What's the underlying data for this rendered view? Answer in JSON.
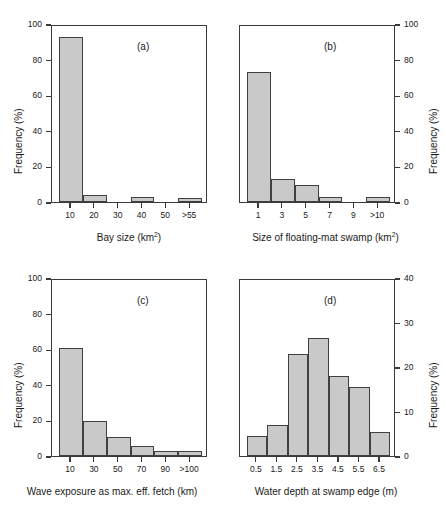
{
  "figure": {
    "panel_count": 4,
    "bar_fill_color": "#c9c9c9",
    "bar_edge_color": "#404040",
    "axis_color": "#3a3a3a"
  },
  "chart_data": [
    {
      "type": "bar",
      "panel": "(a)",
      "title": "",
      "xlabel_text": "Bay size (km",
      "xlabel_sup": "2",
      "xlabel_tail": ")",
      "ylabel": "Frequency (%)",
      "axis_side": "left",
      "categories": [
        "10",
        "20",
        "30",
        "40",
        "50",
        ">55"
      ],
      "values": [
        92.8,
        4.2,
        0,
        3.0,
        0,
        2.0
      ],
      "ylim": [
        0,
        100
      ],
      "yticks": [
        0,
        20,
        40,
        60,
        80,
        100
      ],
      "grid": false,
      "legend": "none"
    },
    {
      "type": "bar",
      "panel": "(b)",
      "title": "",
      "xlabel_text": "Size of floating-mat swamp (km",
      "xlabel_sup": "2",
      "xlabel_tail": ")",
      "ylabel": "Frequency (%)",
      "axis_side": "right",
      "categories": [
        "1",
        "3",
        "5",
        "7",
        "9",
        ">10"
      ],
      "values": [
        73.0,
        13.0,
        9.6,
        3.0,
        0,
        3.0
      ],
      "ylim": [
        0,
        100
      ],
      "yticks": [
        0,
        20,
        40,
        60,
        80,
        100
      ],
      "grid": false,
      "legend": "none"
    },
    {
      "type": "bar",
      "panel": "(c)",
      "title": "",
      "xlabel_text": "Wave exposure as max. eff. fetch (km)",
      "xlabel_sup": "",
      "xlabel_tail": "",
      "ylabel": "Frequency (%)",
      "axis_side": "left",
      "categories": [
        "10",
        "30",
        "50",
        "70",
        "90",
        ">100"
      ],
      "values": [
        60.5,
        19.5,
        10.5,
        5.5,
        3.0,
        3.0
      ],
      "ylim": [
        0,
        100
      ],
      "yticks": [
        0,
        20,
        40,
        60,
        80,
        100
      ],
      "grid": false,
      "legend": "none"
    },
    {
      "type": "bar",
      "panel": "(d)",
      "title": "",
      "xlabel_text": "Water depth at swamp edge (m)",
      "xlabel_sup": "",
      "xlabel_tail": "",
      "ylabel": "Frequency (%)",
      "axis_side": "right",
      "categories": [
        "0.5",
        "1.5",
        "2.5",
        "3.5",
        "4.5",
        "5.5",
        "6.5"
      ],
      "values": [
        4.5,
        7.0,
        23.0,
        26.5,
        18.0,
        15.5,
        5.5
      ],
      "ylim": [
        0,
        40
      ],
      "yticks": [
        0,
        10,
        20,
        30,
        40
      ],
      "grid": false,
      "legend": "none"
    }
  ]
}
